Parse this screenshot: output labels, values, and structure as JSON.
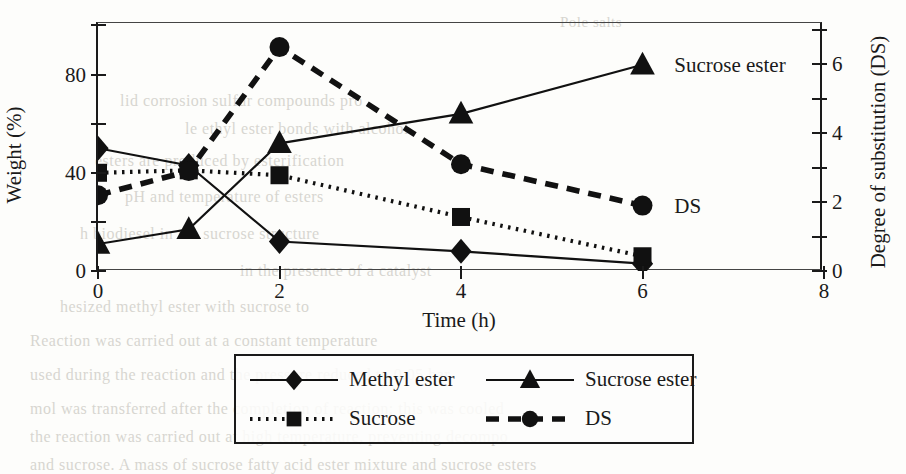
{
  "chart_data": {
    "type": "line",
    "title": "",
    "xlabel": "Time (h)",
    "ylabel": "Weight (%)",
    "ylabel_right": "Degree of substitution (DS)",
    "xlim": [
      0,
      8
    ],
    "ylim": [
      0,
      101
    ],
    "ylim_right": [
      0,
      7.2
    ],
    "grid": false,
    "legend_position": "below-plot",
    "x_ticks_major": [
      0,
      2,
      4,
      6,
      8
    ],
    "x_ticklabels": [
      "0",
      "2",
      "4",
      "6",
      "8"
    ],
    "y_ticks_major": [
      0,
      40,
      80
    ],
    "y_ticklabels": [
      "0",
      "40",
      "80"
    ],
    "y_ticks_minor": [
      20,
      60,
      100
    ],
    "y_right_ticks_major": [
      0,
      2,
      4,
      6
    ],
    "y_right_ticklabels": [
      "0",
      "2",
      "4",
      "6"
    ],
    "y_right_ticks_minor": [
      1,
      3,
      5,
      7
    ],
    "series": [
      {
        "name": "Methyl ester",
        "axis": "left",
        "marker": "diamond",
        "linestyle": "solid",
        "x": [
          0,
          1,
          2,
          4,
          6
        ],
        "values": [
          50,
          43,
          12,
          8,
          3
        ]
      },
      {
        "name": "Sucrose ester",
        "axis": "left",
        "marker": "triangle",
        "linestyle": "solid",
        "x": [
          0,
          1,
          2,
          4,
          6
        ],
        "values": [
          11,
          17,
          52,
          64,
          84
        ]
      },
      {
        "name": "Sucrose",
        "axis": "left",
        "marker": "square",
        "linestyle": "dotted",
        "x": [
          0,
          1,
          2,
          4,
          6
        ],
        "values": [
          40,
          41,
          39,
          22,
          6
        ]
      },
      {
        "name": "DS",
        "axis": "right",
        "marker": "circle",
        "linestyle": "dashed",
        "x": [
          0,
          1,
          2,
          4,
          6
        ],
        "values": [
          2.2,
          2.9,
          6.5,
          3.1,
          1.9
        ]
      }
    ],
    "annotations": [
      {
        "text": "Sucrose ester",
        "x": 6.35,
        "y_axis": "left",
        "y": 84
      },
      {
        "text": "DS",
        "x": 6.35,
        "y_axis": "right",
        "y": 1.9
      }
    ]
  },
  "legend": {
    "items": [
      {
        "label": "Methyl ester",
        "marker": "diamond",
        "linestyle": "solid"
      },
      {
        "label": "Sucrose ester",
        "marker": "triangle",
        "linestyle": "solid"
      },
      {
        "label": "Sucrose",
        "marker": "square",
        "linestyle": "dotted"
      },
      {
        "label": "DS",
        "marker": "circle",
        "linestyle": "dashed"
      }
    ]
  },
  "page_bleed": {
    "lines": [
      {
        "text": "Pole      salts",
        "x": 560,
        "y": 14,
        "size": 15
      },
      {
        "text": "lid corrosion  sulfur  compounds  pro",
        "x": 120,
        "y": 92,
        "size": 16
      },
      {
        "text": "le ethyl  ester  bonds  with  alcohol",
        "x": 185,
        "y": 120,
        "size": 16
      },
      {
        "text": "esters are produced  by  esterification",
        "x": 95,
        "y": 152,
        "size": 16
      },
      {
        "text": "pH and  temperature  of  esters",
        "x": 125,
        "y": 188,
        "size": 16
      },
      {
        "text": "h biodiesel in the  sucrose  structure",
        "x": 80,
        "y": 225,
        "size": 16
      },
      {
        "text": "in  the  presence  of  a  catalyst",
        "x": 240,
        "y": 262,
        "size": 16
      },
      {
        "text": "hesized  methyl  ester  with  sucrose  to",
        "x": 60,
        "y": 298,
        "size": 16
      },
      {
        "text": "Reaction  was  carried  out  at  a  constant  temperature",
        "x": 30,
        "y": 332,
        "size": 16
      },
      {
        "text": "used  during  the  reaction  and  the  pressure  reduced  to  0.05  bar",
        "x": 30,
        "y": 366,
        "size": 16
      },
      {
        "text": "mol  was  transferred  after  the  completion  of  reaction;  this  was  cooled",
        "x": 30,
        "y": 400,
        "size": 16
      },
      {
        "text": "the  reaction  was  carried  out  at  high  temperature,  preventing  decompo",
        "x": 30,
        "y": 428,
        "size": 16
      },
      {
        "text": "and  sucrose.  A  mass  of  sucrose  fatty  acid  ester  mixture  and  sucrose  esters",
        "x": 30,
        "y": 456,
        "size": 16
      }
    ]
  }
}
